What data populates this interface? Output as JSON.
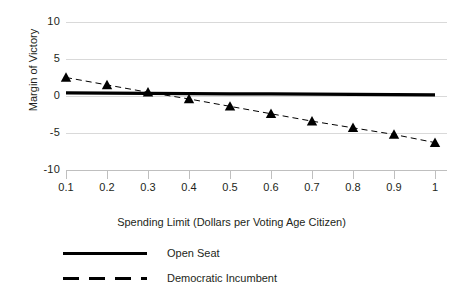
{
  "chart_data": {
    "type": "line",
    "title": "",
    "xlabel": "Spending Limit (Dollars per Voting Age Citizen)",
    "ylabel": "Margin of Victory",
    "x": [
      0.1,
      0.2,
      0.3,
      0.4,
      0.5,
      0.6,
      0.7,
      0.8,
      0.9,
      1
    ],
    "xtick_labels": [
      "0.1",
      "0.2",
      "0.3",
      "0.4",
      "0.5",
      "0.6",
      "0.7",
      "0.8",
      "0.9",
      "1"
    ],
    "ytick_labels": [
      "10",
      "5",
      "0",
      "-5",
      "-10"
    ],
    "ytick_values": [
      10,
      5,
      0,
      -5,
      -10
    ],
    "xlim": [
      0.1,
      1
    ],
    "ylim": [
      -10,
      10
    ],
    "grid": "horizontal",
    "legend_position": "bottom-left",
    "series": [
      {
        "name": "Open Seat",
        "style": "solid",
        "marker": "none",
        "color": "#000000",
        "values": [
          0.42,
          0.39,
          0.36,
          0.33,
          0.3,
          0.28,
          0.25,
          0.22,
          0.19,
          0.16
        ]
      },
      {
        "name": "Democratic Incumbent",
        "style": "dashed",
        "marker": "triangle",
        "color": "#000000",
        "values": [
          2.5,
          1.5,
          0.5,
          -0.4,
          -1.4,
          -2.4,
          -3.4,
          -4.3,
          -5.2,
          -6.3
        ]
      }
    ]
  },
  "legend": {
    "items": [
      {
        "label": "Open Seat",
        "style": "solid"
      },
      {
        "label": "Democratic Incumbent",
        "style": "dashed"
      }
    ]
  },
  "colors": {
    "ink": "#231f20",
    "gridline": "#d9d9d9",
    "axis": "#bfbfbf",
    "series": "#000000",
    "background": "#ffffff"
  }
}
